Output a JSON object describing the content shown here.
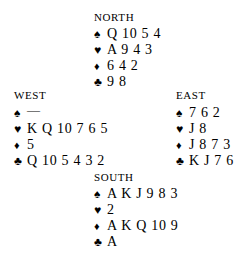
{
  "diagram": {
    "type": "bridge-deal",
    "background_color": "#ffffff",
    "text_color": "#000000",
    "suit_symbols": {
      "spade": "♠",
      "heart": "♥",
      "diamond": "♦",
      "club": "♣"
    },
    "void_marker": "—"
  },
  "hands": {
    "north": {
      "seat_label": "NORTH",
      "suits": [
        {
          "icon": "spade-icon",
          "symbol": "♠",
          "ranks": "Q 10 5 4"
        },
        {
          "icon": "heart-icon",
          "symbol": "♥",
          "ranks": "A 9 4 3"
        },
        {
          "icon": "diamond-icon",
          "symbol": "♦",
          "ranks": "6 4 2"
        },
        {
          "icon": "club-icon",
          "symbol": "♣",
          "ranks": "9 8"
        }
      ]
    },
    "west": {
      "seat_label": "WEST",
      "suits": [
        {
          "icon": "spade-icon",
          "symbol": "♠",
          "ranks": "—"
        },
        {
          "icon": "heart-icon",
          "symbol": "♥",
          "ranks": "K Q 10 7 6 5"
        },
        {
          "icon": "diamond-icon",
          "symbol": "♦",
          "ranks": "5"
        },
        {
          "icon": "club-icon",
          "symbol": "♣",
          "ranks": "Q 10 5 4 3 2"
        }
      ]
    },
    "east": {
      "seat_label": "EAST",
      "suits": [
        {
          "icon": "spade-icon",
          "symbol": "♠",
          "ranks": "7 6 2"
        },
        {
          "icon": "heart-icon",
          "symbol": "♥",
          "ranks": "J 8"
        },
        {
          "icon": "diamond-icon",
          "symbol": "♦",
          "ranks": "J 8 7 3"
        },
        {
          "icon": "club-icon",
          "symbol": "♣",
          "ranks": "K J 7 6"
        }
      ]
    },
    "south": {
      "seat_label": "SOUTH",
      "suits": [
        {
          "icon": "spade-icon",
          "symbol": "♠",
          "ranks": "A K J 9 8 3"
        },
        {
          "icon": "heart-icon",
          "symbol": "♥",
          "ranks": "2"
        },
        {
          "icon": "diamond-icon",
          "symbol": "♦",
          "ranks": "A K Q 10 9"
        },
        {
          "icon": "club-icon",
          "symbol": "♣",
          "ranks": "A"
        }
      ]
    }
  }
}
